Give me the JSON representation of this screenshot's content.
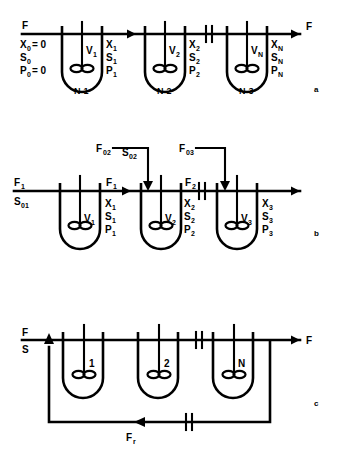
{
  "figure": {
    "background_color": "#ffffff",
    "line_color": "#000000"
  },
  "panels": [
    {
      "id": "a",
      "letter": "a",
      "description": "Simple cascade of N stirred-tank fermentors in series",
      "inlet_labels": [
        "F",
        "X",
        "S",
        "P"
      ],
      "inlet_stream": {
        "flow": "F",
        "X": "X",
        "X_sub": "0",
        "X_value": "= 0",
        "S": "S",
        "S_sub": "0",
        "P": "P",
        "P_sub": "0",
        "P_value": "= 0"
      },
      "outlet_stream": {
        "flow": "F"
      },
      "vessels": [
        {
          "volume": "V",
          "volume_sub": "1",
          "stage": "N-1",
          "out_X": "X",
          "out_X_sub": "1",
          "out_S": "S",
          "out_S_sub": "1",
          "out_P": "P",
          "out_P_sub": "1"
        },
        {
          "volume": "V",
          "volume_sub": "2",
          "stage": "N-2",
          "out_X": "X",
          "out_X_sub": "2",
          "out_S": "S",
          "out_S_sub": "2",
          "out_P": "P",
          "out_P_sub": "2"
        },
        {
          "volume": "V",
          "volume_sub": "N",
          "stage": "N-3",
          "out_X": "X",
          "out_X_sub": "N",
          "out_S": "S",
          "out_S_sub": "N",
          "out_P": "P",
          "out_P_sub": "N"
        }
      ]
    },
    {
      "id": "b",
      "letter": "b",
      "description": "Cascade with additional substrate feed streams to stages 2 and 3",
      "inlet_stream": {
        "flow": "F",
        "flow_sub": "1",
        "S": "S",
        "S_sub": "01"
      },
      "feeds": [
        {
          "flow": "F",
          "flow_sub": "02",
          "S": "S",
          "S_sub": "02"
        },
        {
          "flow": "F",
          "flow_sub": "03"
        }
      ],
      "intermediate_flows": [
        {
          "flow": "F",
          "flow_sub": "1"
        },
        {
          "flow": "F",
          "flow_sub": "2"
        }
      ],
      "vessels": [
        {
          "volume": "V",
          "volume_sub": "1",
          "out_X": "X",
          "out_X_sub": "1",
          "out_S": "S",
          "out_S_sub": "1",
          "out_P": "P",
          "out_P_sub": "1"
        },
        {
          "volume": "V",
          "volume_sub": "2",
          "out_X": "X",
          "out_X_sub": "2",
          "out_S": "S",
          "out_S_sub": "2",
          "out_P": "P",
          "out_P_sub": "2"
        },
        {
          "volume": "V",
          "volume_sub": "3",
          "out_X": "X",
          "out_X_sub": "3",
          "out_S": "S",
          "out_S_sub": "3",
          "out_P": "P",
          "out_P_sub": "3"
        }
      ]
    },
    {
      "id": "c",
      "letter": "c",
      "description": "Cascade of N fermentors with recycle stream",
      "inlet_stream": {
        "flow": "F",
        "S": "S"
      },
      "outlet_stream": {
        "flow": "F"
      },
      "recycle_stream": {
        "flow": "F",
        "flow_sub": "r"
      },
      "vessels": [
        {
          "number": "1"
        },
        {
          "number": "2"
        },
        {
          "number": "N"
        }
      ]
    }
  ],
  "symbols": {
    "break_symbol": "double-slash-break",
    "arrow": "flow-arrow",
    "impeller": "rushton-impeller"
  }
}
